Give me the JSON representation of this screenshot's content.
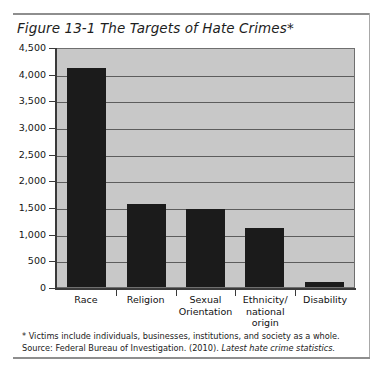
{
  "figure": {
    "title": "Figure 13-1  The Targets of Hate Crimes*",
    "footnote": "* Victims include individuals, businesses, institutions, and society as a whole.",
    "source_prefix": "Source: Federal Bureau of Investigation. (2010). ",
    "source_italic": "Latest hate crime statistics."
  },
  "colors": {
    "bar": "#1b1b1b",
    "plot_background": "#c8c8c8",
    "gridline": "#5d5d5d",
    "axis": "#3a3a3a",
    "page_background": "#ffffff",
    "rule": "#8e8e8e"
  },
  "chart_data": {
    "type": "bar",
    "title": "Figure 13-1  The Targets of Hate Crimes*",
    "xlabel": "",
    "ylabel": "",
    "ylim": [
      0,
      4500
    ],
    "ytick_step": 500,
    "grid": true,
    "legend": "none",
    "categories": [
      "Race",
      "Religion",
      "Sexual Orientation",
      "Ethnicity/ national origin",
      "Disability"
    ],
    "category_lines": [
      [
        "Race"
      ],
      [
        "Religion"
      ],
      [
        "Sexual",
        "Orientation"
      ],
      [
        "Ethnicity/",
        "national",
        "origin"
      ],
      [
        "Disability"
      ]
    ],
    "values": [
      4100,
      1550,
      1470,
      1100,
      100
    ],
    "ytick_labels": [
      "4,500",
      "4,000",
      "3,500",
      "3,000",
      "2,500",
      "2,000",
      "1,500",
      "1,000",
      "500",
      "0"
    ],
    "ytick_values": [
      4500,
      4000,
      3500,
      3000,
      2500,
      2000,
      1500,
      1000,
      500,
      0
    ]
  }
}
